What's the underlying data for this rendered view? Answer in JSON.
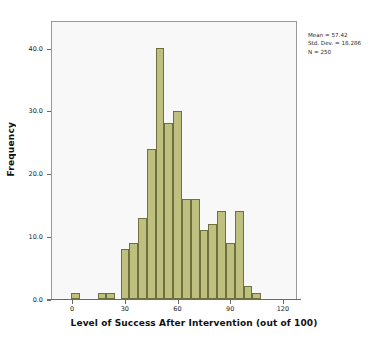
{
  "chart_data": {
    "type": "bar",
    "subtype": "histogram",
    "title": "",
    "xlabel": "Level of Success After Intervention (out of 100)",
    "ylabel": "Frequency",
    "xlim": [
      -12,
      128
    ],
    "ylim": [
      0,
      44.5
    ],
    "grid": false,
    "legend": null,
    "bin_width": 5,
    "bin_starts": [
      -1,
      14,
      19,
      27,
      32,
      37,
      42,
      47,
      52,
      57,
      62,
      67,
      72,
      77,
      82,
      87,
      92,
      97,
      102
    ],
    "categories": [
      "0",
      "15",
      "20",
      "28",
      "33",
      "38",
      "43",
      "48",
      "53",
      "58",
      "63",
      "68",
      "73",
      "78",
      "83",
      "88",
      "93",
      "98",
      "103"
    ],
    "values": [
      1,
      1,
      1,
      8,
      9,
      13,
      24,
      40,
      28,
      30,
      16,
      16,
      11,
      12,
      14,
      9,
      14,
      2,
      1
    ],
    "xticks": [
      0,
      30,
      60,
      90,
      120
    ],
    "xtick_labels": [
      "0",
      "30",
      "60",
      "90",
      "120"
    ],
    "yticks": [
      0,
      10,
      20,
      30,
      40
    ],
    "ytick_labels": [
      "0.0",
      "10.0",
      "20.0",
      "30.0",
      "40.0"
    ],
    "annotations": {
      "mean": "Mean = 57.42",
      "std_dev": "Std. Dev. = 18.286",
      "n": "N = 250"
    },
    "colors": {
      "bar_fill": "#bec07f",
      "bar_border": "#6e7040",
      "plot_background": "#f8f8f8",
      "frame": "#9a9a9a",
      "text": "#1a1a1a"
    }
  }
}
